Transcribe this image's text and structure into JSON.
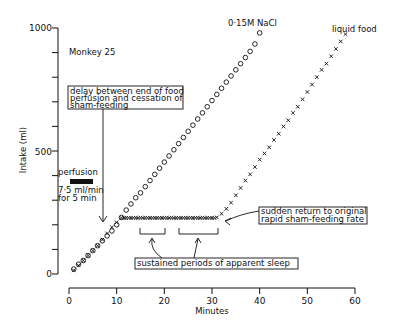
{
  "chart_data": {
    "type": "scatter",
    "title": "Monkey 25",
    "xlabel": "Minutes",
    "ylabel": "Intake (ml)",
    "xlim": [
      0,
      60
    ],
    "ylim": [
      0,
      1000
    ],
    "x_ticks": [
      0,
      10,
      20,
      30,
      40,
      50,
      60
    ],
    "y_ticks_labeled": [
      0,
      500,
      1000
    ],
    "y_minor_step": 100,
    "series": [
      {
        "name": "0·15M NaCl",
        "marker": "circle",
        "x": [
          1,
          2,
          3,
          4,
          5,
          6,
          7,
          8,
          9,
          10,
          11,
          12,
          13,
          14,
          15,
          16,
          17,
          18,
          19,
          20,
          21,
          22,
          23,
          24,
          25,
          26,
          27,
          28,
          29,
          30,
          31,
          32,
          33,
          34,
          35,
          36,
          37,
          38,
          39,
          40
        ],
        "y": [
          20,
          40,
          55,
          75,
          95,
          115,
          135,
          155,
          175,
          200,
          230,
          260,
          285,
          310,
          330,
          355,
          380,
          405,
          430,
          455,
          480,
          505,
          530,
          555,
          580,
          605,
          630,
          655,
          680,
          705,
          730,
          755,
          780,
          805,
          830,
          855,
          880,
          905,
          935,
          980
        ]
      },
      {
        "name": "liquid food",
        "marker": "cross",
        "x": [
          1,
          2,
          3,
          4,
          5,
          6,
          7,
          8,
          9,
          10,
          11,
          12,
          13,
          14,
          15,
          16,
          17,
          18,
          19,
          20,
          21,
          22,
          23,
          24,
          25,
          26,
          27,
          28,
          29,
          30,
          31,
          32,
          33,
          34,
          35,
          36,
          37,
          38,
          39,
          40,
          41,
          42,
          43,
          44,
          45,
          46,
          47,
          48,
          49,
          50,
          51,
          52,
          53,
          54,
          55,
          56,
          57,
          58
        ],
        "y": [
          15,
          35,
          55,
          75,
          95,
          115,
          140,
          165,
          190,
          210,
          228,
          228,
          228,
          228,
          228,
          228,
          228,
          228,
          228,
          228,
          228,
          228,
          228,
          228,
          228,
          228,
          228,
          228,
          228,
          228,
          230,
          245,
          265,
          290,
          320,
          350,
          380,
          405,
          435,
          465,
          490,
          515,
          545,
          570,
          600,
          625,
          655,
          680,
          710,
          740,
          770,
          800,
          830,
          855,
          885,
          915,
          945,
          975
        ]
      }
    ],
    "annotations": [
      {
        "text": "delay between end of food perfusion and cessation of sham-feeding",
        "arrow_to": [
          7.5,
          230
        ]
      },
      {
        "text": "perfusion 7·5 ml/min for 5 min",
        "bar_x": [
          0,
          5
        ]
      },
      {
        "text": "sudden return to original rapid sham-feeding rate",
        "arrow_to": [
          31.5,
          228
        ]
      },
      {
        "text": "sustained periods of apparent sleep",
        "periods": [
          [
            15,
            20
          ],
          [
            23,
            31
          ]
        ]
      }
    ]
  },
  "labels": {
    "monkey": "Monkey 25",
    "nacl": "0·15M NaCl",
    "food": "liquid food",
    "xlabel": "Minutes",
    "ylabel": "Intake (ml)",
    "delay_l1": "delay between end of food",
    "delay_l2": "perfusion and cessation of",
    "delay_l3": "sham-feeding",
    "perf_title": "perfusion",
    "perf_l1": "7·5 ml/min",
    "perf_l2": "for 5 min",
    "return_l1": "sudden return to original",
    "return_l2": "rapid sham-feeding rate",
    "sleep": "sustained periods of apparent sleep",
    "y0": "0",
    "y500": "500",
    "y1000": "1000",
    "x0": "0",
    "x10": "10",
    "x20": "20",
    "x30": "30",
    "x40": "40",
    "x50": "50",
    "x60": "60"
  }
}
